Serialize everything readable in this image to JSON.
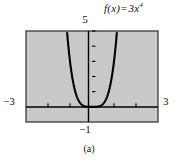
{
  "figure": {
    "caption": "(a)",
    "function_label": {
      "fname": "f",
      "arg": "(x)",
      "equals": "=",
      "coefficient": "3",
      "variable": "x",
      "exponent": "4",
      "full": "f(x) = 3x⁴"
    },
    "labels": {
      "y_top": "5",
      "y_bottom": "−1",
      "x_left": "−3",
      "x_right": "3"
    },
    "colors": {
      "plot_background": "#c9c9c9",
      "page_background": "#ffffff",
      "curve": "#000000",
      "axis": "#000000",
      "border": "#3a3a3a",
      "text": "#111111"
    }
  },
  "chart_data": {
    "type": "line",
    "xlabel": "",
    "ylabel": "",
    "xlim": [
      -3,
      3
    ],
    "ylim": [
      -1,
      5
    ],
    "grid": false,
    "legend": null,
    "xticks": [
      -3,
      -2,
      -1,
      0,
      1,
      2,
      3
    ],
    "xtick_labels": [
      "−3",
      "",
      "",
      "",
      "",
      "",
      "3"
    ],
    "yticks": [
      -1,
      0,
      1,
      2,
      3,
      4,
      5
    ],
    "ytick_labels": [
      "−1",
      "",
      "",
      "",
      "",
      "",
      "5"
    ],
    "equation": "y = 3x^4",
    "series": [
      {
        "name": "f(x) = 3x⁴",
        "x": [
          -1.136,
          -1.1,
          -1.05,
          -1.0,
          -0.95,
          -0.9,
          -0.85,
          -0.8,
          -0.75,
          -0.7,
          -0.6,
          -0.5,
          -0.4,
          -0.3,
          -0.2,
          -0.1,
          0.0,
          0.1,
          0.2,
          0.3,
          0.4,
          0.5,
          0.6,
          0.7,
          0.75,
          0.8,
          0.85,
          0.9,
          0.95,
          1.0,
          1.05,
          1.1,
          1.136
        ],
        "y": [
          5.0,
          4.39,
          3.65,
          3.0,
          2.44,
          1.97,
          1.57,
          1.23,
          0.95,
          0.72,
          0.39,
          0.19,
          0.08,
          0.02,
          0.005,
          0.0003,
          0.0,
          0.0003,
          0.005,
          0.02,
          0.08,
          0.19,
          0.39,
          0.72,
          0.95,
          1.23,
          1.57,
          1.97,
          2.44,
          3.0,
          3.65,
          4.39,
          5.0
        ]
      }
    ]
  }
}
